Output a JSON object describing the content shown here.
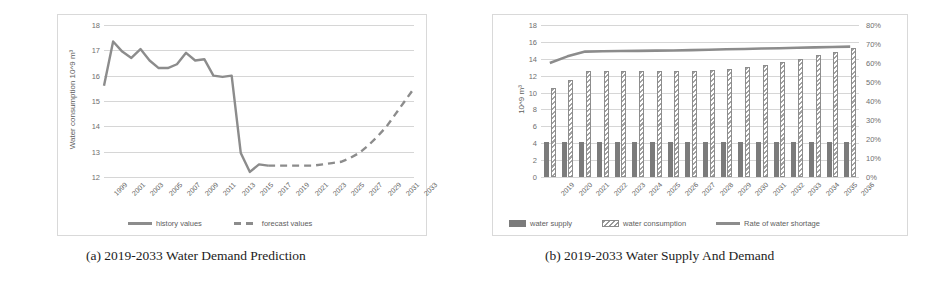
{
  "figure": {
    "panels": [
      {
        "id": "a",
        "caption": "(a) 2019-2033 Water Demand Prediction"
      },
      {
        "id": "b",
        "caption": "(b) 2019-2033 Water Supply And Demand"
      }
    ]
  },
  "chart_data": [
    {
      "type": "line",
      "title": "",
      "xlabel": "",
      "ylabel": "Water consumption  10^9 m³",
      "ylim": [
        12,
        18
      ],
      "yticks": [
        12,
        13,
        14,
        15,
        16,
        17,
        18
      ],
      "ytick_labels": [
        "12",
        "13",
        "14",
        "15",
        "16",
        "17",
        "18"
      ],
      "grid": true,
      "legend_position": "bottom",
      "x": [
        1999,
        2000,
        2001,
        2002,
        2003,
        2004,
        2005,
        2006,
        2007,
        2008,
        2009,
        2010,
        2011,
        2012,
        2013,
        2014,
        2015,
        2016,
        2017,
        2018,
        2019,
        2020,
        2021,
        2022,
        2023,
        2024,
        2025,
        2026,
        2027,
        2028,
        2029,
        2030,
        2031,
        2032,
        2033
      ],
      "xtick_labels": [
        "1999",
        "2001",
        "2003",
        "2005",
        "2007",
        "2009",
        "2011",
        "2013",
        "2015",
        "2017",
        "2019",
        "2021",
        "2023",
        "2025",
        "2027",
        "2029",
        "2031",
        "2033"
      ],
      "series": [
        {
          "name": "history values",
          "style": "solid",
          "color": "#8c8c8c",
          "x": [
            1999,
            2000,
            2001,
            2002,
            2003,
            2004,
            2005,
            2006,
            2007,
            2008,
            2009,
            2010,
            2011,
            2012,
            2013,
            2014,
            2015,
            2016,
            2017
          ],
          "values": [
            15.6,
            17.35,
            16.95,
            16.7,
            17.05,
            16.6,
            16.3,
            16.3,
            16.45,
            16.9,
            16.6,
            16.65,
            16.0,
            15.95,
            16.0,
            12.95,
            12.2,
            12.5,
            12.45
          ]
        },
        {
          "name": "forecast values",
          "style": "dashed",
          "color": "#8c8c8c",
          "x": [
            2017,
            2018,
            2019,
            2020,
            2021,
            2022,
            2023,
            2024,
            2025,
            2026,
            2027,
            2028,
            2029,
            2030,
            2031,
            2032,
            2033
          ],
          "values": [
            12.45,
            12.45,
            12.45,
            12.45,
            12.45,
            12.45,
            12.5,
            12.55,
            12.6,
            12.75,
            12.95,
            13.25,
            13.6,
            14.0,
            14.5,
            15.0,
            15.5
          ]
        }
      ]
    },
    {
      "type": "bar",
      "title": "",
      "xlabel": "",
      "ylabel": "10^9 m³",
      "ylim": [
        0,
        18
      ],
      "yticks": [
        0,
        2,
        4,
        6,
        8,
        10,
        12,
        14,
        16,
        18
      ],
      "ytick_labels": [
        "0",
        "2",
        "4",
        "6",
        "8",
        "10",
        "12",
        "14",
        "16",
        "18"
      ],
      "y2lim": [
        0,
        80
      ],
      "y2ticks": [
        0,
        10,
        20,
        30,
        40,
        50,
        60,
        70,
        80
      ],
      "y2tick_labels": [
        "0%",
        "10%",
        "20%",
        "30%",
        "40%",
        "50%",
        "60%",
        "70%",
        "80%"
      ],
      "grid": true,
      "legend_position": "bottom",
      "categories": [
        "2019",
        "2020",
        "2021",
        "2022",
        "2023",
        "2024",
        "2025",
        "2026",
        "2027",
        "2028",
        "2029",
        "2030",
        "2031",
        "2032",
        "2033",
        "2034",
        "2035",
        "2036"
      ],
      "series": [
        {
          "name": "water supply",
          "type": "bar",
          "axis": "left",
          "color": "#7b7b7b",
          "values": [
            4.1,
            4.1,
            4.1,
            4.1,
            4.1,
            4.1,
            4.1,
            4.1,
            4.1,
            4.1,
            4.1,
            4.1,
            4.1,
            4.1,
            4.1,
            4.1,
            4.1,
            4.1
          ]
        },
        {
          "name": "water consumption",
          "type": "bar",
          "axis": "left",
          "color": "#a2a2a2",
          "values": [
            10.5,
            11.5,
            12.5,
            12.5,
            12.5,
            12.5,
            12.5,
            12.5,
            12.6,
            12.7,
            12.8,
            13.0,
            13.3,
            13.6,
            14.0,
            14.4,
            14.8,
            15.3
          ]
        },
        {
          "name": "Rate of water shortage",
          "type": "line",
          "axis": "right",
          "color": "#8c8c8c",
          "values": [
            60.0,
            63.5,
            66.0,
            66.2,
            66.3,
            66.4,
            66.5,
            66.6,
            66.8,
            67.0,
            67.2,
            67.4,
            67.6,
            67.8,
            68.0,
            68.2,
            68.4,
            68.6
          ]
        }
      ]
    }
  ]
}
